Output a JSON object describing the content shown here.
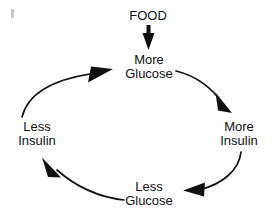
{
  "diagram": {
    "background_color": "#ffffff",
    "stroke_color": "#101010",
    "nodes": [
      {
        "id": "food",
        "label": "FOOD",
        "position": "top"
      },
      {
        "id": "more-glucose",
        "label": "More\nGlucose",
        "position": "top-center"
      },
      {
        "id": "more-insulin",
        "label": "More\nInsulin",
        "position": "right"
      },
      {
        "id": "less-glucose",
        "label": "Less\nGlucose",
        "position": "bottom"
      },
      {
        "id": "less-insulin",
        "label": "Less\nInsulin",
        "position": "left"
      }
    ],
    "arrows": [
      {
        "id": "food-to-more-glucose",
        "from": "food",
        "to": "more-glucose",
        "shape": "straight-down"
      },
      {
        "id": "more-glucose-to-more-insulin",
        "from": "more-glucose",
        "to": "more-insulin",
        "shape": "curve-clockwise"
      },
      {
        "id": "more-insulin-to-less-glucose",
        "from": "more-insulin",
        "to": "less-glucose",
        "shape": "curve-clockwise"
      },
      {
        "id": "less-glucose-to-less-insulin",
        "from": "less-glucose",
        "to": "less-insulin",
        "shape": "curve-clockwise"
      },
      {
        "id": "less-insulin-to-more-glucose",
        "from": "less-insulin",
        "to": "more-glucose",
        "shape": "curve-clockwise"
      }
    ]
  }
}
